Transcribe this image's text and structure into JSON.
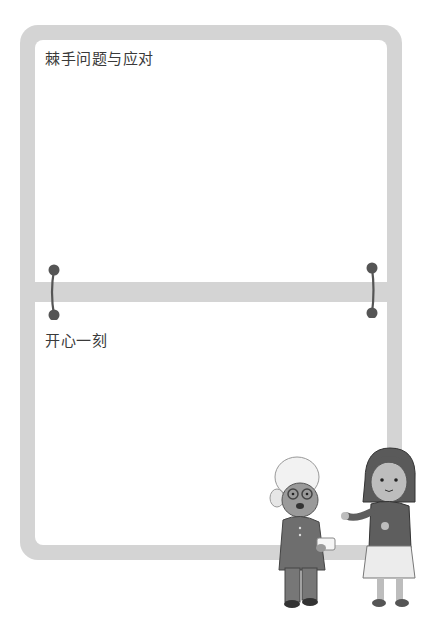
{
  "sections": [
    {
      "title": "棘手问题与应对"
    },
    {
      "title": "开心一刻"
    }
  ],
  "colors": {
    "frame": "#d4d4d4",
    "ring": "#555555",
    "text": "#3a3a3a"
  },
  "illustration": {
    "description": "elderly woman with white hair and glasses holding a paper, girl with dark bob hair gesturing"
  }
}
